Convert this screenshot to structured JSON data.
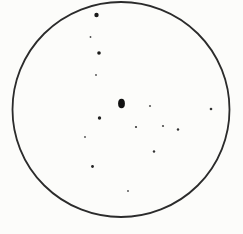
{
  "diagram": {
    "background_color": "#fcfcfa",
    "field_circle": {
      "cx": 121,
      "cy": 109.5,
      "rx": 108.5,
      "ry": 107.5,
      "stroke_color": "#2b2b2b",
      "stroke_width": 1.8,
      "fill": "none"
    },
    "central_blob": {
      "cx": 121.5,
      "cy": 103.5,
      "rx": 3.4,
      "ry": 4.7,
      "color": "#111111"
    },
    "dots": [
      {
        "cx": 96.5,
        "cy": 15,
        "rx": 2.2,
        "ry": 2.2,
        "color": "#1a1a1a"
      },
      {
        "cx": 90.5,
        "cy": 37,
        "rx": 0.9,
        "ry": 0.9,
        "color": "#4a4a4a"
      },
      {
        "cx": 99,
        "cy": 53,
        "rx": 1.8,
        "ry": 1.8,
        "color": "#1a1a1a"
      },
      {
        "cx": 96,
        "cy": 75,
        "rx": 0.9,
        "ry": 0.9,
        "color": "#4a4a4a"
      },
      {
        "cx": 150,
        "cy": 106,
        "rx": 1.1,
        "ry": 1.1,
        "color": "#5a5a5a"
      },
      {
        "cx": 211,
        "cy": 109,
        "rx": 1.3,
        "ry": 1.3,
        "color": "#333333"
      },
      {
        "cx": 99.5,
        "cy": 118,
        "rx": 1.7,
        "ry": 1.7,
        "color": "#222222"
      },
      {
        "cx": 136,
        "cy": 127,
        "rx": 1.1,
        "ry": 1.1,
        "color": "#383838"
      },
      {
        "cx": 163,
        "cy": 126,
        "rx": 1.1,
        "ry": 1.1,
        "color": "#4a4a4a"
      },
      {
        "cx": 178,
        "cy": 129.5,
        "rx": 1.2,
        "ry": 1.2,
        "color": "#333333"
      },
      {
        "cx": 85,
        "cy": 137,
        "rx": 0.9,
        "ry": 0.9,
        "color": "#4a4a4a"
      },
      {
        "cx": 154,
        "cy": 151.5,
        "rx": 1.2,
        "ry": 1.2,
        "color": "#333333"
      },
      {
        "cx": 92.5,
        "cy": 166.5,
        "rx": 1.4,
        "ry": 1.4,
        "color": "#222222"
      },
      {
        "cx": 128,
        "cy": 191,
        "rx": 0.9,
        "ry": 0.9,
        "color": "#4a4a4a"
      }
    ]
  }
}
